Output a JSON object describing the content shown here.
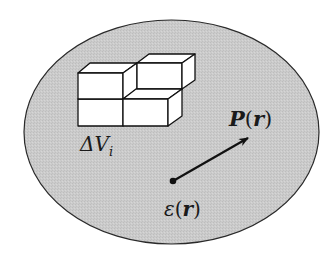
{
  "diagram": {
    "title": "",
    "region": {
      "shape": "ellipse",
      "fill": "#c9c9c9",
      "stroke": "#2a2a2a"
    },
    "labels": {
      "volume_element": {
        "main": "ΔV",
        "subscript": "i"
      },
      "polarization": {
        "symbol": "P",
        "open": "(",
        "arg": "r",
        "close": ")"
      },
      "permittivity": {
        "symbol": "ε",
        "open": "(",
        "arg": "r",
        "close": ")"
      }
    },
    "elements": [
      {
        "id": "volume-cubes",
        "description": "stack of four small cubes representing volume elements"
      },
      {
        "id": "polarization-vector",
        "description": "arrow from a point to upper right"
      },
      {
        "id": "origin-point",
        "description": "black dot at arrow start"
      }
    ],
    "colors": {
      "background": "#ffffff",
      "region_fill": "#c9c9c9",
      "line": "#111111",
      "cube_face": "#ffffff"
    }
  }
}
